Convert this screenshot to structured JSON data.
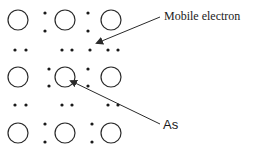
{
  "diagram": {
    "title": "",
    "labels": {
      "mobile_electron": "Mobile electron",
      "as": "As"
    },
    "atoms": {
      "rows": 3,
      "cols": 3,
      "dopant_position": {
        "row": 1,
        "col": 1
      },
      "dopant_symbol": "As"
    },
    "colors": {
      "stroke": "#2a2a2a",
      "text": "#1a1a1a",
      "background": "#ffffff"
    }
  }
}
